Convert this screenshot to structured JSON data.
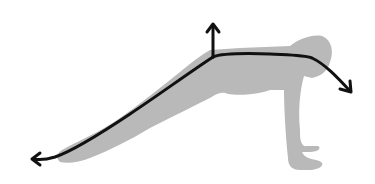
{
  "figure": {
    "colors": {
      "background": "#ffffff",
      "silhouette": "#b8b8b8",
      "arrow": "#111111"
    },
    "arrows": [
      {
        "name": "hip-up-arrow",
        "direction": "up"
      },
      {
        "name": "leg-arrow",
        "direction": "down-left"
      },
      {
        "name": "spine-arrow",
        "direction": "right-down"
      }
    ]
  }
}
